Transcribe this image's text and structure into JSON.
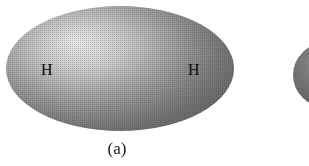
{
  "figure": {
    "caption": "(a)",
    "background_color": "#ffffff",
    "width": 309,
    "height": 166
  },
  "main_cloud": {
    "name": "h2-electron-cloud",
    "shape": "ellipse",
    "highlight_color": "#f2f2f2",
    "mid_color": "#a3a3a3",
    "edge_color": "#6a6a6a",
    "texture": "halftone-dot-screen"
  },
  "atoms": [
    {
      "label": "H",
      "position": "left"
    },
    {
      "label": "H",
      "position": "right"
    }
  ],
  "partial_cloud": {
    "name": "adjacent-figure-fragment",
    "shape": "ellipse",
    "edge_color": "#5c5c5c",
    "mid_color": "#7e7e7e"
  }
}
